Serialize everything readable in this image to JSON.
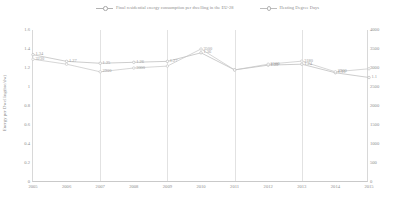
{
  "chart_data": {
    "type": "line",
    "title": "",
    "x": [
      2005,
      2006,
      2007,
      2008,
      2009,
      2010,
      2011,
      2012,
      2013,
      2014,
      2015
    ],
    "categories": [
      "2005",
      "2006",
      "2007",
      "2008",
      "2009",
      "2010",
      "2011",
      "2012",
      "2013",
      "2014",
      "2015"
    ],
    "xlabel": "",
    "grid": "vertical",
    "legend_position": "top-center",
    "series": [
      {
        "name": "Final residential energy consumption per dwelling in the EU-28",
        "axis": "left",
        "unit": "toe/dw",
        "values": [
          1.34,
          1.27,
          1.25,
          1.26,
          1.27,
          1.36,
          1.18,
          1.23,
          1.24,
          1.15,
          1.1
        ],
        "labels": [
          "1.34",
          "1.27",
          "1.25",
          "1.26",
          "1.27",
          "1.36",
          "",
          "1.23",
          "1.24",
          "1.15",
          "1.1"
        ],
        "color": "#b8b8b8"
      },
      {
        "name": "Heating Degree Days",
        "axis": "right",
        "unit": "HDD",
        "values": [
          3230,
          3100,
          2900,
          3000,
          3050,
          3500,
          2950,
          3100,
          3180,
          2900,
          2980
        ],
        "labels": [
          "3230",
          "",
          "2900",
          "3000",
          "",
          "3500",
          "",
          "3100",
          "3180",
          "2900",
          ""
        ],
        "color": "#c4c4c4"
      }
    ],
    "y_left": {
      "label": "Energy per Dwelling(toe/dw)",
      "ticks": [
        "0",
        "0.2",
        "0.4",
        "0.6",
        "0.8",
        "1",
        "1.2",
        "1.4",
        "1.6"
      ],
      "min": 0,
      "max": 1.6
    },
    "y_right": {
      "label": "Heating degree days",
      "ticks": [
        "0",
        "500",
        "1000",
        "1500",
        "2000",
        "2500",
        "3000",
        "3500",
        "4000"
      ],
      "min": 0,
      "max": 4000
    }
  },
  "legend": {
    "entries": [
      {
        "label": "Final residential energy consumption per dwelling in the EU-28"
      },
      {
        "label": "Heating Degree Days"
      }
    ]
  },
  "caption": ""
}
